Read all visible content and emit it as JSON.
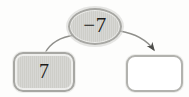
{
  "diagram": {
    "type": "operation-machine",
    "operation_label": "−7",
    "input_value": "7",
    "output_value": "",
    "colors": {
      "shape_fill": "#d3d3d0",
      "shape_border": "#a7a7a3",
      "answer_box_fill": "#ffffff",
      "answer_box_border": "#b2b2ae",
      "connector_line": "#8f8f8b",
      "arrowhead": "#4e4e4b",
      "text": "#1c1c1a"
    }
  }
}
